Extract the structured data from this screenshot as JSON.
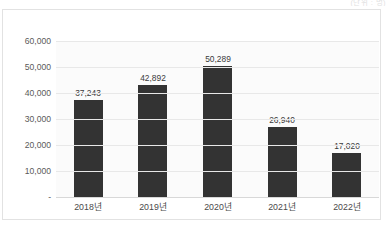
{
  "unit_note": "(단위 : 명)",
  "chart_data": {
    "type": "bar",
    "title": "",
    "subtitle": "",
    "xlabel": "",
    "ylabel": "",
    "categories": [
      "2018년",
      "2019년",
      "2020년",
      "2021년",
      "2022년"
    ],
    "values": [
      37243,
      42892,
      50289,
      26940,
      17020
    ],
    "data_labels": [
      "37,243",
      "42,892",
      "50,289",
      "26,940",
      "17,020"
    ],
    "ylim": [
      0,
      60000
    ],
    "ytick_values": [
      60000,
      50000,
      40000,
      30000,
      20000,
      10000,
      0
    ],
    "ytick_labels": [
      "60,000",
      "50,000",
      "40,000",
      "30,000",
      "20,000",
      "10,000",
      "-"
    ],
    "grid": true,
    "legend": false,
    "legend_position": "none",
    "series": [
      {
        "name": "",
        "values": [
          37243,
          42892,
          50289,
          26940,
          17020
        ]
      }
    ],
    "colors": {
      "bar": "#333333",
      "plot_background": "#fbfbfb",
      "gridline": "#e8e8e8",
      "frame_border": "#e2e2e2",
      "tick_text": "#5a5a5a",
      "label_text": "#3a3a3a",
      "unit_note_text": "#c9c9c9"
    }
  }
}
